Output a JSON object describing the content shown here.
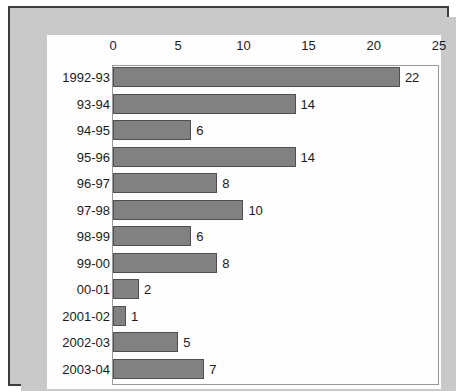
{
  "chart_data": {
    "type": "bar",
    "orientation": "horizontal",
    "title": "",
    "subtitle": "",
    "xlabel": "",
    "ylabel": "",
    "xlim": [
      0,
      25
    ],
    "ylim": null,
    "grid": false,
    "legend": null,
    "legend_position": "none",
    "xticks": [
      "0",
      "5",
      "10",
      "15",
      "20",
      "25"
    ],
    "xtick_values": [
      0,
      5,
      10,
      15,
      20,
      25
    ],
    "categories": [
      "1992-93",
      "93-94",
      "94-95",
      "95-96",
      "96-97",
      "97-98",
      "98-99",
      "99-00",
      "00-01",
      "2001-02",
      "2002-03",
      "2003-04"
    ],
    "values": [
      22,
      14,
      6,
      14,
      8,
      10,
      6,
      8,
      2,
      1,
      5,
      7
    ],
    "data_labels": [
      "22",
      "14",
      "6",
      "14",
      "8",
      "10",
      "6",
      "8",
      "2",
      "1",
      "5",
      "7"
    ],
    "annotations": []
  },
  "style": {
    "bar_fill": "#818181",
    "bar_edge": "#4f4f4f",
    "plot_background": "#fdfdfd",
    "mat_background": "#c9c9c9",
    "frame_border": "#3d3d3d",
    "axis_line": "#9a9a9a",
    "text_color": "#1b1b1b"
  }
}
